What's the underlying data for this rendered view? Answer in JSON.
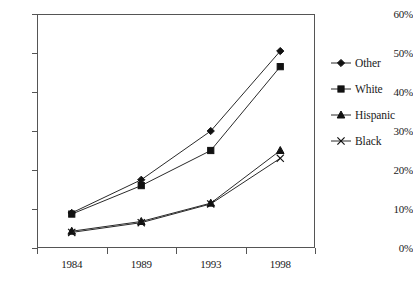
{
  "chart_data": {
    "type": "line",
    "title": "",
    "subtitle": "",
    "xlabel": "",
    "ylabel": "",
    "categories": [
      "1984",
      "1989",
      "1993",
      "1998"
    ],
    "ylim": [
      0,
      60
    ],
    "ytick_labels": [
      "0%",
      "10%",
      "20%",
      "30%",
      "40%",
      "50%",
      "60%"
    ],
    "ytick_values": [
      0,
      10,
      20,
      30,
      40,
      50,
      60
    ],
    "grid": false,
    "legend_position": "right",
    "series": [
      {
        "name": "Other",
        "marker": "diamond",
        "values": [
          9.0,
          17.5,
          30.0,
          50.5
        ]
      },
      {
        "name": "White",
        "marker": "square",
        "values": [
          8.7,
          16.0,
          25.0,
          46.5
        ]
      },
      {
        "name": "Hispanic",
        "marker": "triangle",
        "values": [
          4.3,
          6.8,
          11.5,
          25.0
        ]
      },
      {
        "name": "Black",
        "marker": "cross",
        "values": [
          4.0,
          6.5,
          11.3,
          23.0
        ]
      }
    ]
  },
  "legend": {
    "items": [
      {
        "label": "Other",
        "marker": "diamond-marker-icon"
      },
      {
        "label": "White",
        "marker": "square-marker-icon"
      },
      {
        "label": "Hispanic",
        "marker": "triangle-marker-icon"
      },
      {
        "label": "Black",
        "marker": "cross-marker-icon"
      }
    ]
  },
  "colors": {
    "line": "#2a2a2a",
    "marker": "#111111",
    "axis": "#555555",
    "background": "#ffffff"
  }
}
